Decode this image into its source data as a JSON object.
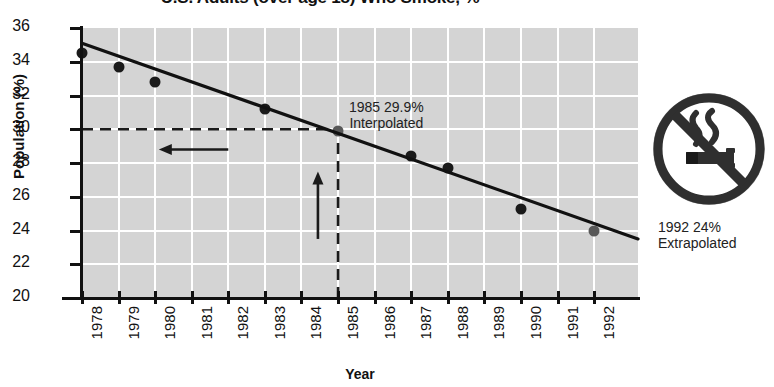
{
  "chart_data": {
    "type": "scatter",
    "title": "U.S. Adults (over age 18) Who Smoke, %",
    "xlabel": "Year",
    "ylabel": "Population (%)",
    "xlim": [
      1978,
      1993.2
    ],
    "ylim": [
      20,
      36
    ],
    "ytick_labels": [
      "36",
      "34",
      "32",
      "30",
      "28",
      "26",
      "24",
      "22",
      "20"
    ],
    "ytick_values": [
      36,
      34,
      32,
      30,
      28,
      26,
      24,
      22,
      20
    ],
    "xtick_labels": [
      "1978",
      "1979",
      "1980",
      "1981",
      "1982",
      "1983",
      "1984",
      "1985",
      "1986",
      "1987",
      "1988",
      "1989",
      "1990",
      "1991",
      "1992"
    ],
    "xtick_values": [
      1978,
      1979,
      1980,
      1981,
      1982,
      1983,
      1984,
      1985,
      1986,
      1987,
      1988,
      1989,
      1990,
      1991,
      1992
    ],
    "grid": true,
    "grid_color": "#ffffff",
    "plot_background": "#d4d4d4",
    "legend": "none",
    "series": [
      {
        "name": "Measured",
        "marker_color": "#1a1a1a",
        "points": [
          {
            "x": 1978,
            "y": 34.5
          },
          {
            "x": 1979,
            "y": 33.7
          },
          {
            "x": 1980,
            "y": 32.8
          },
          {
            "x": 1983,
            "y": 31.2
          },
          {
            "x": 1987,
            "y": 28.4
          },
          {
            "x": 1988,
            "y": 27.7
          },
          {
            "x": 1990,
            "y": 25.3
          }
        ]
      },
      {
        "name": "Estimated",
        "marker_color": "#585858",
        "points": [
          {
            "x": 1985,
            "y": 29.9,
            "note": "Interpolated"
          },
          {
            "x": 1992,
            "y": 24.0,
            "note": "Extrapolated"
          }
        ]
      }
    ],
    "trendline": {
      "name": "Linear fit",
      "color": "#111111",
      "start": {
        "x": 1978,
        "y": 35.1
      },
      "end": {
        "x": 1993.2,
        "y": 23.5
      }
    },
    "annotations": [
      {
        "name": "interpolated-callout",
        "line1": "1985 29.9%",
        "line2": "Interpolated",
        "x": 1985,
        "y": 29.9
      },
      {
        "name": "extrapolated-callout",
        "line1": "1992 24%",
        "line2": "Extrapolated",
        "x": 1992,
        "y": 24.0
      }
    ],
    "guides": [
      {
        "name": "horizontal-dashed-guide",
        "type": "dashed-horizontal",
        "y": 30,
        "from_x": 1978,
        "to_x": 1985
      },
      {
        "name": "vertical-dashed-guide",
        "type": "dashed-vertical",
        "x": 1985,
        "from_y": 20,
        "to_y": 29.9
      },
      {
        "name": "left-arrow",
        "type": "arrow-left",
        "y": 28.8,
        "from_x": 1982.0,
        "to_x": 1980.1
      },
      {
        "name": "up-arrow",
        "type": "arrow-up",
        "x": 1984.45,
        "from_y": 23.5,
        "to_y": 27.5
      }
    ]
  },
  "icon": {
    "name": "no-smoking-icon",
    "label": "No Smoking",
    "ring_color": "#333333",
    "fill_color": "#ffffff"
  }
}
